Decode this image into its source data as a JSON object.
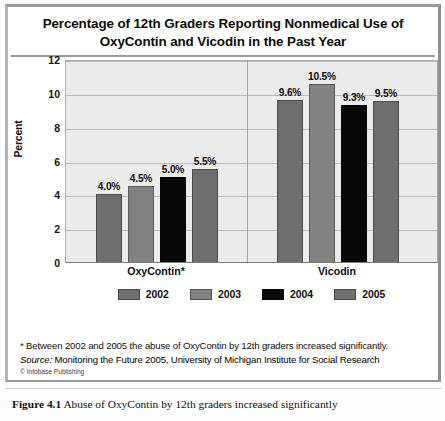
{
  "title": "Percentage of 12th Graders Reporting Nonmedical Use of OxyContin and Vicodin in the Past Year",
  "title_line1": "Percentage of 12th Graders Reporting Nonmedical Use of",
  "title_line2": "OxyContin and Vicodin in the Past Year",
  "notes": {
    "footnote": "* Between 2002 and 2005 the abuse of OxyContin by 12th graders increased significantly.",
    "source_label": "Source:",
    "source_text": "Monitoring the Future 2005, University of Michigan Institute for Social Research",
    "credit": "© Infobase Publishing"
  },
  "caption": {
    "figure_number": "Figure 4.1",
    "text": "Abuse of OxyContin by 12th graders increased significantly"
  },
  "chart_data": {
    "type": "bar",
    "title": "Percentage of 12th Graders Reporting Nonmedical Use of OxyContin and Vicodin in the Past Year",
    "xlabel": "",
    "ylabel": "Percent",
    "ylim": [
      0,
      12
    ],
    "yticks": [
      0,
      2,
      4,
      6,
      8,
      10,
      12
    ],
    "ytick_labels": [
      "0",
      "2",
      "4",
      "6",
      "8",
      "10",
      "12"
    ],
    "grid": true,
    "legend_position": "bottom",
    "categories": [
      "OxyContin*",
      "Vicodin"
    ],
    "series": [
      {
        "name": "2002",
        "color": "#6e6e6e",
        "values": [
          4.0,
          9.6
        ],
        "labels": [
          "4.0%",
          "9.6%"
        ]
      },
      {
        "name": "2003",
        "color": "#828282",
        "values": [
          4.5,
          10.5
        ],
        "labels": [
          "4.5%",
          "10.5%"
        ]
      },
      {
        "name": "2004",
        "color": "#080808",
        "values": [
          5.0,
          9.3
        ],
        "labels": [
          "5.0%",
          "9.3%"
        ]
      },
      {
        "name": "2005",
        "color": "#6e6e6e",
        "values": [
          5.5,
          9.5
        ],
        "labels": [
          "5.5%",
          "9.5%"
        ]
      }
    ]
  }
}
